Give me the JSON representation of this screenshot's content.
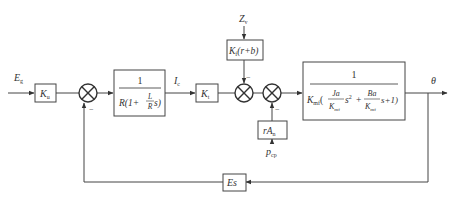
{
  "diagram": {
    "type": "control-system-block-diagram",
    "inputs": {
      "reference": {
        "symbol": "E",
        "sub": "g"
      },
      "disturbance_top": {
        "symbol": "Z",
        "sub": "v"
      },
      "disturbance_bottom": {
        "symbol": "p",
        "sub": "cp"
      }
    },
    "signals": {
      "current": {
        "symbol": "I",
        "sub": "c"
      },
      "output": {
        "symbol": "θ"
      }
    },
    "blocks": {
      "ku": {
        "main": "K",
        "sub": "u"
      },
      "current_loop": {
        "numerator": "1",
        "den_prefix": "R(1+",
        "frac_num": "L",
        "frac_den": "R",
        "den_suffix": " s)"
      },
      "kt": {
        "main": "K",
        "sub": "t"
      },
      "kf": {
        "main": "K",
        "sub": "f",
        "tail": "(r+b)"
      },
      "ran": {
        "pre": "rA",
        "sub": "n"
      },
      "plant": {
        "numerator": "1",
        "lead": "K",
        "lead_sub": "mf",
        "t1_num": "Ja",
        "t1_den": "K",
        "t1_den_sub": "mf",
        "t1_pow": "s",
        "t1_exp": "2",
        "plus": "+",
        "t2_num": "Ba",
        "t2_den": "K",
        "t2_den_sub": "mf",
        "t2_tail": "s+1)"
      },
      "es": {
        "label": "Es"
      }
    },
    "junction_signs": {
      "sum1_bottom": "−",
      "sum2_top": "−",
      "sum3_bottom": "−"
    }
  }
}
